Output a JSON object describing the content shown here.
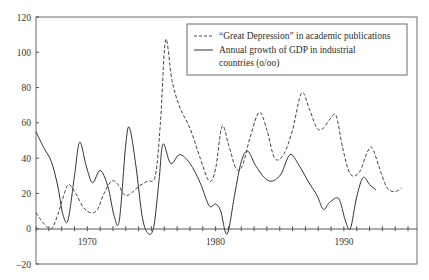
{
  "chart_data": {
    "type": "line",
    "title": "",
    "xlabel": "",
    "ylabel": "",
    "xlim": [
      1966,
      1995.7
    ],
    "ylim": [
      -20,
      120
    ],
    "grid": false,
    "legend_position": "upper right (inside)",
    "x_ticks": {
      "minor_every_years": 1,
      "labels": [
        {
          "value": 1970,
          "label": "1970"
        },
        {
          "value": 1980,
          "label": "1980"
        },
        {
          "value": 1990,
          "label": "1990"
        }
      ]
    },
    "y_ticks": [
      {
        "value": -20,
        "label": "–20"
      },
      {
        "value": 0,
        "label": "0"
      },
      {
        "value": 20,
        "label": "20"
      },
      {
        "value": 40,
        "label": "40"
      },
      {
        "value": 60,
        "label": "60"
      },
      {
        "value": 80,
        "label": "80"
      },
      {
        "value": 100,
        "label": "100"
      },
      {
        "value": 120,
        "label": "120"
      }
    ],
    "series": [
      {
        "name": "“Great Depression” in academic publications",
        "style": "dashed",
        "color": "#444444",
        "x": [
          1966,
          1966.6,
          1967.2,
          1967.7,
          1968.3,
          1968.6,
          1969.1,
          1969.7,
          1970.3,
          1970.8,
          1971.3,
          1971.9,
          1972.4,
          1972.9,
          1973.4,
          1974,
          1974.7,
          1975.3,
          1975.7,
          1976.1,
          1976.6,
          1977.2,
          1978,
          1978.8,
          1979.5,
          1980,
          1980.5,
          1981,
          1981.6,
          1982.1,
          1982.7,
          1983.4,
          1984,
          1984.6,
          1985.3,
          1986,
          1986.7,
          1987.3,
          1987.9,
          1988.4,
          1988.9,
          1989.4,
          1989.9,
          1990.5,
          1991.2,
          1991.8,
          1992.2,
          1992.7,
          1993.3,
          1993.9,
          1994.5
        ],
        "values": [
          9,
          3,
          0,
          8,
          22,
          25,
          20,
          12,
          9,
          11,
          20,
          27,
          25,
          19,
          20,
          24,
          27,
          30,
          60,
          107,
          84,
          69,
          57,
          40,
          27,
          34,
          58,
          48,
          34,
          36,
          52,
          66,
          56,
          40,
          42,
          56,
          77,
          68,
          57,
          57,
          62,
          64,
          46,
          31,
          32,
          43,
          46,
          36,
          24,
          21,
          23
        ]
      },
      {
        "name": "Annual growth of GDP in industrial countries (o/oo)",
        "style": "solid",
        "color": "#333333",
        "x": [
          1966,
          1966.6,
          1967.2,
          1967.7,
          1968.1,
          1968.5,
          1969,
          1969.4,
          1969.9,
          1970.4,
          1971,
          1971.6,
          1972.1,
          1972.5,
          1973,
          1973.3,
          1973.8,
          1974.3,
          1974.8,
          1975.2,
          1975.6,
          1975.9,
          1976.5,
          1977.2,
          1978,
          1978.8,
          1979.5,
          1980,
          1980.4,
          1980.9,
          1981.5,
          1982,
          1982.5,
          1983.1,
          1983.8,
          1984.4,
          1985.1,
          1985.8,
          1986.5,
          1987.2,
          1987.9,
          1988.4,
          1988.9,
          1989.6,
          1990.1,
          1990.5,
          1991,
          1991.5,
          1992,
          1992.5
        ],
        "values": [
          55,
          46,
          38,
          24,
          8,
          5,
          30,
          49,
          36,
          26,
          33,
          24,
          7,
          5,
          48,
          57,
          35,
          6,
          -3,
          2,
          28,
          48,
          37,
          42,
          37,
          26,
          13,
          14,
          10,
          -3,
          20,
          38,
          44,
          36,
          29,
          27,
          31,
          42,
          36,
          27,
          19,
          11,
          15,
          17,
          5,
          0,
          18,
          29,
          25,
          22
        ]
      }
    ]
  },
  "legend": {
    "items": [
      {
        "label_line1": "“Great Depression” in academic publications",
        "label_line2": "",
        "style": "dashed"
      },
      {
        "label_line1": "Annual growth of GDP in industrial",
        "label_line2": "countries (o/oo)",
        "style": "solid"
      }
    ]
  },
  "colors": {
    "axis": "#555555",
    "frame": "#6a6a6a",
    "background": "#ffffff"
  }
}
